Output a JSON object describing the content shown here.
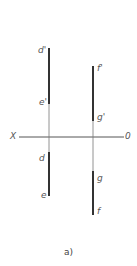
{
  "figure": {
    "caption": "a)",
    "axis": {
      "left_label": "X",
      "right_label": "0"
    },
    "colors": {
      "thick_line": "#333333",
      "thin_line": "#777777",
      "axis": "#555555",
      "label": "#555555"
    },
    "lines": [
      {
        "name": "line-de",
        "labels": {
          "top_elevation": "d'",
          "bottom_elevation": "e'",
          "top_plan": "d",
          "bottom_plan": "e"
        }
      },
      {
        "name": "line-fg",
        "labels": {
          "top_elevation": "f'",
          "bottom_elevation": "g'",
          "top_plan": "g",
          "bottom_plan": "f"
        }
      }
    ]
  }
}
